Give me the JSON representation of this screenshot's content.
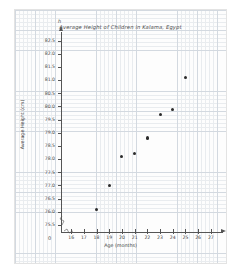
{
  "figure": {
    "background_color": "#ffffff",
    "panel_color": "#fdfdfd",
    "grid_minor_color": "#e9ecef",
    "grid_major_color": "#d3d9e0",
    "axis_color": "#555555",
    "point_color": "#2b2b2b"
  },
  "chart_data": {
    "type": "scatter",
    "title": "Average Height of Children in Kalama, Egypt",
    "xlabel": "Age (months)",
    "ylabel": "Average Height (cm)",
    "x_axis_variable": "a",
    "y_axis_variable": "h",
    "origin_label": "0",
    "grid": true,
    "legend": "none",
    "xlim": [
      15.2,
      27.8
    ],
    "ylim": [
      75.25,
      82.75
    ],
    "x_ticks": [
      16,
      17,
      18,
      19,
      20,
      21,
      22,
      23,
      24,
      25,
      26,
      27
    ],
    "x_tick_labels": [
      "16",
      "17",
      "18",
      "19",
      "20",
      "21",
      "22",
      "23",
      "24",
      "25",
      "26",
      "27"
    ],
    "y_ticks": [
      75.5,
      76.0,
      76.5,
      77.0,
      77.5,
      78.0,
      78.5,
      79.0,
      79.5,
      80.0,
      80.5,
      81.0,
      81.5,
      82.0,
      82.5
    ],
    "y_tick_labels": [
      "75.5",
      "76.0",
      "76.5",
      "77.0",
      "77.5",
      "78.0",
      "78.5",
      "79.0",
      "79.5",
      "80.0",
      "80.5",
      "81.0",
      "81.5",
      "82.0",
      "82.5"
    ],
    "axis_break_x": true,
    "axis_break_y": true,
    "x": [
      18,
      19,
      20,
      21,
      22,
      23,
      24,
      25
    ],
    "y": [
      76.1,
      77.0,
      78.1,
      78.2,
      78.8,
      79.7,
      79.9,
      81.1
    ],
    "points": [
      {
        "x": 18,
        "y": 76.1
      },
      {
        "x": 19,
        "y": 77.0
      },
      {
        "x": 20,
        "y": 78.1
      },
      {
        "x": 21,
        "y": 78.2
      },
      {
        "x": 22,
        "y": 78.8
      },
      {
        "x": 23,
        "y": 79.7
      },
      {
        "x": 24,
        "y": 79.9
      },
      {
        "x": 25,
        "y": 81.1
      }
    ]
  }
}
